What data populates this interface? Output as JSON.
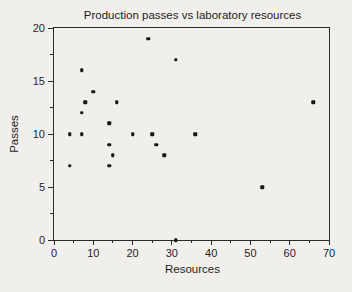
{
  "chart_data": {
    "type": "scatter",
    "title": "Production passes vs laboratory resources",
    "xlabel": "Resources",
    "ylabel": "Passes",
    "xlim": [
      0,
      70
    ],
    "ylim": [
      0,
      20
    ],
    "xticks": [
      0,
      10,
      20,
      30,
      40,
      50,
      60,
      70
    ],
    "yticks": [
      0,
      5,
      10,
      15,
      20
    ],
    "x_minor_step": 5,
    "y_minor_step": 2.5,
    "grid": false,
    "legend": false,
    "points": [
      [
        4,
        7
      ],
      [
        4,
        10
      ],
      [
        7,
        10
      ],
      [
        7,
        12
      ],
      [
        7,
        16
      ],
      [
        8,
        13
      ],
      [
        10,
        14
      ],
      [
        14,
        7
      ],
      [
        14,
        9
      ],
      [
        14,
        11
      ],
      [
        15,
        8
      ],
      [
        16,
        13
      ],
      [
        20,
        10
      ],
      [
        24,
        19
      ],
      [
        25,
        10
      ],
      [
        26,
        9
      ],
      [
        28,
        8
      ],
      [
        31,
        0
      ],
      [
        31,
        17
      ],
      [
        36,
        10
      ],
      [
        53,
        5
      ],
      [
        66,
        13
      ]
    ]
  },
  "colors": {
    "background": "#f1efec",
    "axis": "#2b2b2b",
    "text": "#1f1f1f",
    "marker": "#161616"
  }
}
